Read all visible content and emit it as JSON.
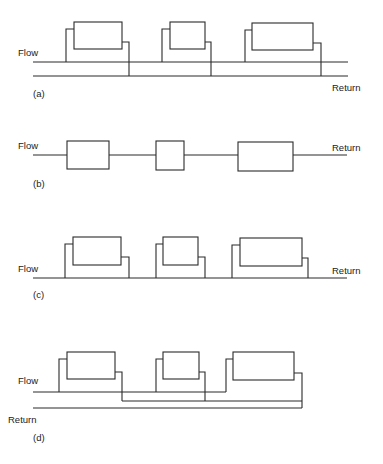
{
  "colors": {
    "line": "#2a2a2a",
    "text": "#222222",
    "background": "#ffffff"
  },
  "panels": [
    {
      "id": "a",
      "caption": "(a)",
      "flow_label": "Flow",
      "return_label": "Return",
      "description": "Two-pipe system with separate flow and return mains",
      "flow_line": {
        "x1": 33,
        "x2": 348,
        "y": 62
      },
      "return_line": {
        "x1": 33,
        "x2": 348,
        "y": 76
      },
      "radiators": [
        {
          "x": 74,
          "y": 22,
          "w": 48,
          "h": 27,
          "in_x": 66,
          "in_y": 29,
          "out_x": 129,
          "out_y": 42,
          "in_to": 62,
          "out_to": 76
        },
        {
          "x": 170,
          "y": 22,
          "w": 35,
          "h": 27,
          "in_x": 162,
          "in_y": 29,
          "out_x": 211,
          "out_y": 42,
          "in_to": 62,
          "out_to": 76
        },
        {
          "x": 252,
          "y": 23,
          "w": 61,
          "h": 27,
          "in_x": 245,
          "in_y": 30,
          "out_x": 321,
          "out_y": 43,
          "in_to": 62,
          "out_to": 76
        }
      ],
      "labels_pos": {
        "flow": [
          18,
          56
        ],
        "return": [
          332,
          91
        ],
        "caption": [
          33,
          97
        ]
      }
    },
    {
      "id": "b",
      "caption": "(b)",
      "flow_label": "Flow",
      "return_label": "Return",
      "description": "Series loop system with radiators in line",
      "line": {
        "x1": 33,
        "x2": 347,
        "y": 155
      },
      "radiators": [
        {
          "x": 67,
          "y": 141,
          "w": 42,
          "h": 28
        },
        {
          "x": 156,
          "y": 141,
          "w": 28,
          "h": 29
        },
        {
          "x": 238,
          "y": 142,
          "w": 55,
          "h": 29
        }
      ],
      "labels_pos": {
        "flow": [
          18,
          149
        ],
        "return": [
          332,
          151
        ],
        "caption": [
          33,
          187
        ]
      }
    },
    {
      "id": "c",
      "caption": "(c)",
      "flow_label": "Flow",
      "return_label": "Return",
      "description": "One-pipe system with radiators connected to a single main",
      "line": {
        "x1": 33,
        "x2": 347,
        "y": 278
      },
      "radiators": [
        {
          "x": 73,
          "y": 237,
          "w": 48,
          "h": 28,
          "in_x": 65,
          "in_y": 244,
          "out_x": 129,
          "out_y": 257
        },
        {
          "x": 163,
          "y": 237,
          "w": 35,
          "h": 28,
          "in_x": 156,
          "in_y": 244,
          "out_x": 205,
          "out_y": 257
        },
        {
          "x": 240,
          "y": 238,
          "w": 62,
          "h": 28,
          "in_x": 232,
          "in_y": 245,
          "out_x": 308,
          "out_y": 258
        }
      ],
      "labels_pos": {
        "flow": [
          18,
          272
        ],
        "return": [
          332,
          274
        ],
        "caption": [
          33,
          298
        ]
      }
    },
    {
      "id": "d",
      "caption": "(d)",
      "flow_label": "Flow",
      "return_label": "Return",
      "description": "Two-pipe reverse-return system",
      "flow_line": {
        "x1": 33,
        "x2": 226,
        "y": 392
      },
      "mid_line": {
        "x1": 122,
        "x2": 302,
        "y": 401
      },
      "return_line": {
        "x1": 33,
        "x2": 302,
        "y": 408
      },
      "radiators": [
        {
          "x": 67,
          "y": 352,
          "w": 48,
          "h": 27,
          "in_x": 59,
          "in_y": 359,
          "out_x": 122,
          "out_y": 372,
          "in_to": 392,
          "out_to": 401
        },
        {
          "x": 163,
          "y": 352,
          "w": 36,
          "h": 27,
          "in_x": 156,
          "in_y": 359,
          "out_x": 205,
          "out_y": 372,
          "in_to": 392,
          "out_to": 401
        },
        {
          "x": 233,
          "y": 352,
          "w": 61,
          "h": 28,
          "in_x": 226,
          "in_y": 359,
          "out_x": 302,
          "out_y": 373,
          "in_to": 392,
          "out_to": 408
        }
      ],
      "labels_pos": {
        "flow": [
          18,
          384
        ],
        "return": [
          8,
          423
        ],
        "caption": [
          33,
          441
        ]
      }
    }
  ]
}
